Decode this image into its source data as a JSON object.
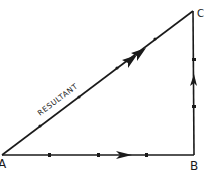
{
  "diagram": {
    "colors": {
      "line": "#1a1a1a",
      "background": "#ffffff"
    },
    "vertices": [
      {
        "id": "A",
        "label": "A",
        "x": 2,
        "y": 155
      },
      {
        "id": "B",
        "label": "B",
        "x": 194,
        "y": 155
      },
      {
        "id": "C",
        "label": "C",
        "x": 193,
        "y": 11
      }
    ],
    "edges": [
      {
        "from": "A",
        "to": "B",
        "arrow": "single",
        "ticks": 3
      },
      {
        "from": "B",
        "to": "C",
        "arrow": "single",
        "ticks": 2
      },
      {
        "from": "A",
        "to": "C",
        "arrow": "double",
        "ticks": 4,
        "label": "RESULTANT"
      }
    ],
    "labels": {
      "a": "A",
      "b": "B",
      "c": "C",
      "resultant": "RESULTANT"
    }
  }
}
